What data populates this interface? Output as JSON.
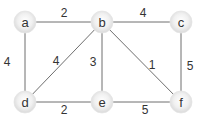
{
  "diagram": {
    "type": "weighted-undirected-graph",
    "colors": {
      "edge": "#6e6e6e",
      "node_fill_center": "#ffffff",
      "node_fill_edge": "#d9d9d9",
      "text": "#333333"
    },
    "nodes": [
      {
        "id": "a",
        "label": "a",
        "x": 25,
        "y": 22
      },
      {
        "id": "b",
        "label": "b",
        "x": 102,
        "y": 22
      },
      {
        "id": "c",
        "label": "c",
        "x": 181,
        "y": 22
      },
      {
        "id": "d",
        "label": "d",
        "x": 25,
        "y": 102
      },
      {
        "id": "e",
        "label": "e",
        "x": 102,
        "y": 102
      },
      {
        "id": "f",
        "label": "f",
        "x": 181,
        "y": 102
      }
    ],
    "edges": [
      {
        "from": "a",
        "to": "b",
        "weight": "2",
        "lx": 64,
        "ly": 17
      },
      {
        "from": "b",
        "to": "c",
        "weight": "4",
        "lx": 143,
        "ly": 17
      },
      {
        "from": "a",
        "to": "d",
        "weight": "4",
        "lx": 7,
        "ly": 66
      },
      {
        "from": "b",
        "to": "d",
        "weight": "4",
        "lx": 56,
        "ly": 65
      },
      {
        "from": "b",
        "to": "e",
        "weight": "3",
        "lx": 93,
        "ly": 66
      },
      {
        "from": "b",
        "to": "f",
        "weight": "1",
        "lx": 152,
        "ly": 69
      },
      {
        "from": "c",
        "to": "f",
        "weight": "5",
        "lx": 190,
        "ly": 70
      },
      {
        "from": "d",
        "to": "e",
        "weight": "2",
        "lx": 64,
        "ly": 114
      },
      {
        "from": "e",
        "to": "f",
        "weight": "5",
        "lx": 145,
        "ly": 114
      }
    ]
  }
}
